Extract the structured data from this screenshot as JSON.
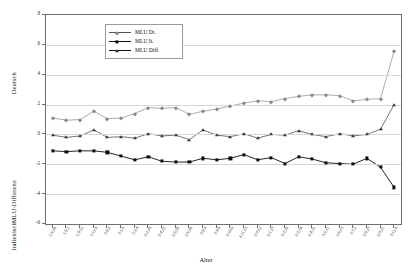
{
  "chart_data": {
    "type": "line",
    "title": "",
    "xlabel": "Alter",
    "ylabel": "MLU-Differenz",
    "ylabel_top": "Deutsch",
    "ylabel_bottom": "Italienisch",
    "ylim": [
      -6,
      8
    ],
    "yticks": [
      8,
      6,
      4,
      2,
      0,
      -2,
      -4,
      -6
    ],
    "grid": true,
    "legend_position": "top-center",
    "categories": [
      "1;6;26",
      "1;8;1",
      "1;9;12",
      "1;11;0",
      "2;0;2",
      "2;1;0",
      "2;2;4",
      "2;3;26",
      "2;4;22",
      "2;5;28",
      "2;6;26",
      "2;8;0",
      "2;9;0",
      "2;10;6",
      "2;11;15",
      "3;0;12",
      "3;1;27",
      "3;2;26",
      "3;3;24",
      "3;4;21",
      "3;5;11",
      "3;6;23",
      "3;7;2",
      "3;8;27",
      "3;9;21",
      "3;11;6"
    ],
    "series": [
      {
        "name": "MLU Dt.",
        "marker": "diamond",
        "color": "#8a8a8a",
        "values": [
          1.1,
          0.95,
          1.0,
          1.55,
          1.05,
          1.1,
          1.4,
          1.8,
          1.75,
          1.8,
          1.35,
          1.55,
          1.7,
          1.9,
          2.1,
          2.25,
          2.2,
          2.4,
          2.55,
          2.65,
          2.65,
          2.6,
          2.25,
          2.35,
          2.4,
          5.6
        ]
      },
      {
        "name": "MLU It.",
        "marker": "square",
        "color": "#0d0d0d",
        "values": [
          -1.1,
          -1.15,
          -1.1,
          -1.1,
          -1.2,
          -1.45,
          -1.7,
          -1.5,
          -1.8,
          -1.85,
          -1.85,
          -1.6,
          -1.7,
          -1.6,
          -1.35,
          -1.7,
          -1.55,
          -1.95,
          -1.5,
          -1.65,
          -1.9,
          -1.95,
          -2.0,
          -1.6,
          -2.2,
          -3.55
        ]
      },
      {
        "name": "MLU Diff",
        "marker": "triangle",
        "color": "#3a3a3a",
        "values": [
          -0.05,
          -0.2,
          -0.1,
          0.3,
          -0.2,
          -0.15,
          -0.25,
          0.05,
          -0.1,
          -0.05,
          -0.35,
          0.3,
          -0.05,
          -0.15,
          0.05,
          -0.25,
          0.0,
          -0.05,
          0.25,
          0.0,
          -0.15,
          0.05,
          -0.1,
          0.0,
          0.35,
          2.0
        ]
      }
    ]
  },
  "axis": {
    "x_title": "Alter"
  }
}
